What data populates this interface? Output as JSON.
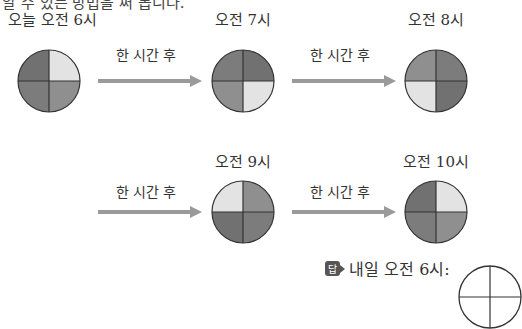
{
  "header": {
    "cut_text": "알 수 있는 방법을 써 봅니다."
  },
  "colors": {
    "dark": "#717171",
    "dark2": "#7c7c7c",
    "medium": "#8f8f8f",
    "light": "#e3e3e3",
    "arrow": "#9a9a9a",
    "line": "#333333"
  },
  "clocks": [
    {
      "label": "오늘 오전 6시",
      "quadrants": {
        "tl": "dark",
        "tr": "light",
        "br": "medium",
        "bl": "dark2"
      }
    },
    {
      "label": "오전 7시",
      "quadrants": {
        "tl": "dark2",
        "tr": "dark",
        "br": "light",
        "bl": "medium"
      }
    },
    {
      "label": "오전 8시",
      "quadrants": {
        "tl": "medium",
        "tr": "dark2",
        "br": "dark",
        "bl": "light"
      }
    },
    {
      "label": "오전 9시",
      "quadrants": {
        "tl": "light",
        "tr": "medium",
        "br": "dark2",
        "bl": "dark"
      }
    },
    {
      "label": "오전 10시",
      "quadrants": {
        "tl": "dark",
        "tr": "light",
        "br": "medium",
        "bl": "dark2"
      }
    }
  ],
  "arrows": [
    {
      "label": "한 시간 후"
    },
    {
      "label": "한 시간 후"
    },
    {
      "label": "한 시간 후"
    },
    {
      "label": "한 시간 후"
    }
  ],
  "answer": {
    "badge": "답",
    "label": "내일 오전 6시:"
  }
}
